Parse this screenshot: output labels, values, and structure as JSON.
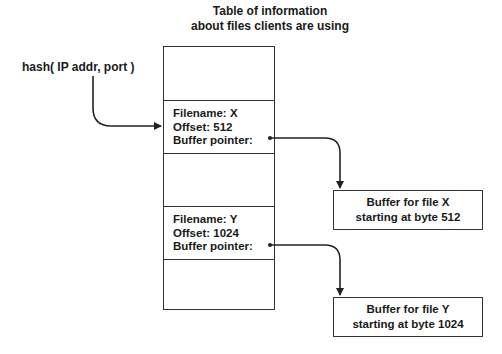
{
  "title": {
    "line1": "Table of information",
    "line2": "about files clients are using"
  },
  "hash_label": "hash( IP addr, port )",
  "table": {
    "rows": [
      {
        "lines": []
      },
      {
        "lines": [
          "Filename: X",
          "Offset: 512",
          "Buffer pointer:"
        ]
      },
      {
        "lines": []
      },
      {
        "lines": [
          "Filename: Y",
          "Offset: 1024",
          "Buffer pointer:"
        ]
      },
      {
        "lines": []
      }
    ]
  },
  "buffers": [
    {
      "line1": "Buffer for file X",
      "line2": "starting at byte 512"
    },
    {
      "line1": "Buffer for file Y",
      "line2": "starting at byte 1024"
    }
  ],
  "colors": {
    "stroke": "#333333",
    "background": "#ffffff"
  }
}
